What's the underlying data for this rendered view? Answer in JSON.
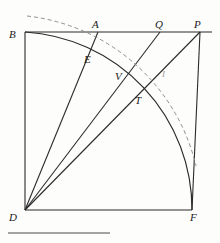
{
  "figure": {
    "name": "geometric-construction-diagram",
    "caption_rule_visible": true,
    "stroke_color": "#2b2b2b",
    "faint_stroke_color": "#8e8e8e",
    "background_color": "#fdfdfc",
    "labels": [
      {
        "id": "B",
        "text": "B",
        "x": 9,
        "y": 29,
        "faint": false
      },
      {
        "id": "A",
        "text": "A",
        "x": 92,
        "y": 19,
        "faint": false
      },
      {
        "id": "Q",
        "text": "Q",
        "x": 155,
        "y": 19,
        "faint": false
      },
      {
        "id": "P",
        "text": "P",
        "x": 194,
        "y": 19,
        "faint": false
      },
      {
        "id": "E",
        "text": "E",
        "x": 84,
        "y": 54,
        "faint": false
      },
      {
        "id": "V",
        "text": "V",
        "x": 115,
        "y": 71,
        "faint": false
      },
      {
        "id": "I",
        "text": "I",
        "x": 162,
        "y": 69,
        "faint": true
      },
      {
        "id": "T",
        "text": "T",
        "x": 135,
        "y": 95,
        "faint": false
      },
      {
        "id": "D",
        "text": "D",
        "x": 9,
        "y": 212,
        "faint": false
      },
      {
        "id": "F",
        "text": "F",
        "x": 190,
        "y": 212,
        "faint": false
      }
    ],
    "vertices": {
      "D": {
        "x": 25,
        "y": 210
      },
      "B": {
        "x": 25,
        "y": 32
      },
      "F": {
        "x": 192,
        "y": 210
      },
      "A": {
        "x": 98,
        "y": 32
      },
      "Q": {
        "x": 160,
        "y": 32
      },
      "P": {
        "x": 200,
        "y": 32
      }
    },
    "segments": [
      {
        "name": "vertical-side-BD",
        "from": "B",
        "to": "D",
        "style": "solid"
      },
      {
        "name": "horizontal-line-BP",
        "from": "B",
        "to": "P",
        "style": "solid"
      },
      {
        "name": "baseline-DF",
        "from": "D",
        "to": "F",
        "style": "solid"
      },
      {
        "name": "right-side-PF",
        "from": "P",
        "to": "F",
        "style": "solid"
      },
      {
        "name": "ray-DA",
        "from": "D",
        "to": "A",
        "style": "solid"
      },
      {
        "name": "ray-DQ",
        "from": "D",
        "to": "Q",
        "style": "solid"
      },
      {
        "name": "ray-DP",
        "from": "D",
        "to": "P",
        "style": "solid"
      }
    ],
    "arcs": [
      {
        "name": "solid-quarter-arc-BF",
        "style": "solid",
        "center": "D",
        "radius": 178,
        "start": {
          "x": 25,
          "y": 32
        },
        "end": {
          "x": 192,
          "y": 210
        }
      },
      {
        "name": "dashed-outer-arc",
        "style": "dashed",
        "center": "D",
        "radius": 196,
        "start": {
          "x": 27,
          "y": 16
        },
        "end": {
          "x": 196,
          "y": 166
        }
      }
    ],
    "caption_rule": {
      "x1": 8,
      "y1": 233,
      "x2": 110,
      "y2": 233
    }
  }
}
